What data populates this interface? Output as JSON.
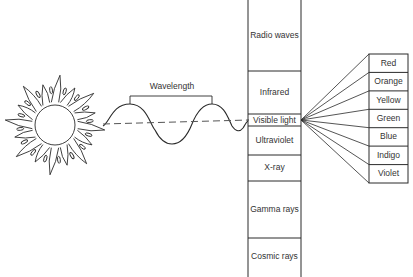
{
  "figure": {
    "wavelength_label": "Wavelength",
    "source_icon": "sun-icon"
  },
  "spectrum": {
    "bands": [
      {
        "label": "Radio waves",
        "top": 0,
        "bottom": 71
      },
      {
        "label": "Infrared",
        "top": 71,
        "bottom": 114
      },
      {
        "label": "Visible light",
        "top": 114,
        "bottom": 126
      },
      {
        "label": "Ultraviolet",
        "top": 126,
        "bottom": 155
      },
      {
        "label": "X-ray",
        "top": 155,
        "bottom": 181
      },
      {
        "label": "Gamma rays",
        "top": 181,
        "bottom": 238
      },
      {
        "label": "Cosmic rays",
        "top": 238,
        "bottom": 277
      }
    ]
  },
  "visible_colors": {
    "items": [
      "Red",
      "Orange",
      "Yellow",
      "Green",
      "Blue",
      "Indigo",
      "Violet"
    ]
  },
  "colors": {
    "line": "#2a2a2a",
    "background": "#ffffff"
  }
}
